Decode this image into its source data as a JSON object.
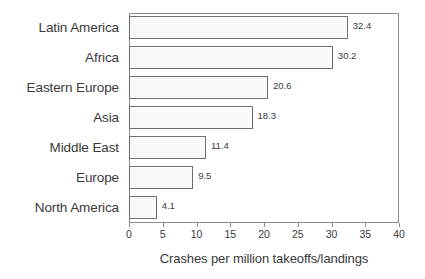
{
  "chart_data": {
    "type": "bar",
    "orientation": "horizontal",
    "title": "",
    "subtitle": "",
    "xlabel": "Crashes per million takeoffs/landings",
    "ylabel": "",
    "xlim": [
      0,
      40
    ],
    "xticks": [
      0,
      5,
      10,
      15,
      20,
      25,
      30,
      35,
      40
    ],
    "xtick_labels": [
      "0",
      "5",
      "10",
      "15",
      "20",
      "25",
      "30",
      "35",
      "40"
    ],
    "grid": false,
    "legend": null,
    "legend_position": "none",
    "categories": [
      "Latin America",
      "Africa",
      "Eastern Europe",
      "Asia",
      "Middle East",
      "Europe",
      "North America"
    ],
    "values": [
      32.4,
      30.2,
      20.6,
      18.3,
      11.4,
      9.5,
      4.1
    ],
    "value_labels": [
      "32.4",
      "30.2",
      "20.6",
      "18.3",
      "11.4",
      "9.5",
      "4.1"
    ],
    "bars": [
      {
        "category": "Latin America",
        "value": 32.4,
        "label": "32.4"
      },
      {
        "category": "Africa",
        "value": 30.2,
        "label": "30.2"
      },
      {
        "category": "Eastern Europe",
        "value": 20.6,
        "label": "20.6"
      },
      {
        "category": "Asia",
        "value": 18.3,
        "label": "18.3"
      },
      {
        "category": "Middle East",
        "value": 11.4,
        "label": "11.4"
      },
      {
        "category": "Europe",
        "value": 9.5,
        "label": "9.5"
      },
      {
        "category": "North America",
        "value": 4.1,
        "label": "4.1"
      }
    ],
    "colors": {
      "bar_fill": "#ececec",
      "bar_pattern": "#969696",
      "bar_edge": "#6e6e6e",
      "axis": "#8c8c8c",
      "text": "#3a3a3a",
      "background": "#ffffff"
    }
  }
}
